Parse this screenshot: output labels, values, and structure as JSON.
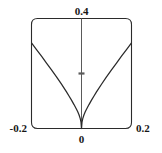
{
  "chart_data": {
    "type": "line",
    "title": "",
    "xlabel": "",
    "ylabel": "",
    "xlim": [
      -0.2,
      0.2
    ],
    "ylim": [
      0,
      0.4
    ],
    "grid": false,
    "legend": null,
    "frame": "rounded-box",
    "axis": {
      "vertical_axis_at_x": 0,
      "vertical_tick_values": [
        0.2
      ],
      "x_tick_labels": [
        "-0.2",
        "0",
        "0.2"
      ],
      "x_tick_values": [
        -0.2,
        0,
        0.2
      ],
      "y_tick_labels": [
        "0.4"
      ],
      "y_tick_values": [
        0.4
      ]
    },
    "labels": {
      "top": "0.4",
      "bottom_left": "-0.2",
      "bottom_center": "0",
      "bottom_right": "0.2"
    },
    "series": [
      {
        "name": "cusp curve",
        "description": "symmetric cusp, minimum 0 at x=0, rises to ~0.31 at x=±0.2",
        "x": [
          -0.2,
          -0.18,
          -0.16,
          -0.14,
          -0.12,
          -0.1,
          -0.08,
          -0.06,
          -0.05,
          -0.04,
          -0.03,
          -0.02,
          -0.015,
          -0.01,
          -0.005,
          -0.002,
          0,
          0.002,
          0.005,
          0.01,
          0.015,
          0.02,
          0.03,
          0.04,
          0.05,
          0.06,
          0.08,
          0.1,
          0.12,
          0.14,
          0.16,
          0.18,
          0.2
        ],
        "y": [
          0.311,
          0.287,
          0.263,
          0.238,
          0.213,
          0.188,
          0.161,
          0.133,
          0.118,
          0.103,
          0.087,
          0.07,
          0.061,
          0.05,
          0.036,
          0.023,
          0.0,
          0.023,
          0.036,
          0.05,
          0.061,
          0.07,
          0.087,
          0.103,
          0.118,
          0.133,
          0.161,
          0.188,
          0.213,
          0.238,
          0.263,
          0.287,
          0.311
        ]
      }
    ],
    "colors": {
      "curve": "#2a2a2a",
      "frame": "#2b2b2b",
      "axis": "#5a5a5a",
      "text": "#161616",
      "background": "#ffffff"
    }
  }
}
